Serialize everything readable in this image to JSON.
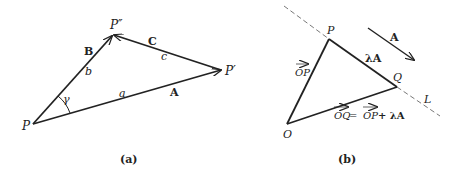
{
  "figure_a": {
    "caption": "(a)",
    "points": {
      "P": "P",
      "P_prime": "P′",
      "P_double_prime": "P″"
    },
    "vectors": {
      "A": "A",
      "B": "B",
      "C": "C"
    },
    "sides": {
      "a": "a",
      "b": "b",
      "c": "c"
    },
    "angle": "γ"
  },
  "figure_b": {
    "caption": "(b)",
    "points": {
      "P": "P",
      "Q": "Q",
      "O": "O"
    },
    "line_label": "L",
    "vector_A": "A",
    "segment_PQ": "λA",
    "vector_OP": "OP",
    "equation": {
      "lhs": "OQ",
      "eq": " = ",
      "op": "OP",
      "plus": " + λA"
    }
  },
  "colors": {
    "stroke": "#222222",
    "dashed_line": "#555555",
    "background": "#ffffff"
  }
}
